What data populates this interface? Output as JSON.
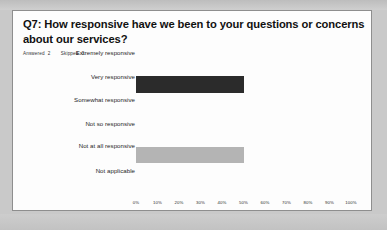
{
  "card": {
    "title": "Q7: How responsive have we been to your questions or concerns about our services?",
    "meta": {
      "answered_label": "Answered",
      "answered_value": "2",
      "skipped_label": "Skipped",
      "skipped_value": "0"
    }
  },
  "colors": {
    "bar_dark": "#2b2b2b",
    "bar_light": "#b4b4b4",
    "card_background": "#fdfdfd",
    "card_border": "#8e8e8e",
    "page_background": "#c9c9c9",
    "text": "#111111"
  },
  "chart_data": {
    "type": "bar",
    "orientation": "horizontal",
    "title": "Q7: How responsive have we been to your questions or concerns about our services?",
    "xlabel": "",
    "ylabel": "",
    "xlim": [
      0,
      100
    ],
    "grid": false,
    "legend": "none",
    "categories": [
      "Extremely responsive",
      "Very responsive",
      "Somewhat responsive",
      "Not so responsive",
      "Not at all responsive",
      "Not applicable"
    ],
    "values": [
      0,
      50,
      0,
      0,
      50,
      0
    ],
    "value_unit": "%",
    "bar_colors": [
      "#2b2b2b",
      "#2b2b2b",
      "#2b2b2b",
      "#2b2b2b",
      "#b4b4b4",
      "#2b2b2b"
    ],
    "tick_labels": [
      "0%",
      "10%",
      "20%",
      "30%",
      "40%",
      "50%",
      "60%",
      "70%",
      "80%",
      "90%",
      "100%"
    ],
    "tick_values": [
      0,
      10,
      20,
      30,
      40,
      50,
      60,
      70,
      80,
      90,
      100
    ],
    "responses": {
      "answered": 2,
      "skipped": 0
    }
  }
}
